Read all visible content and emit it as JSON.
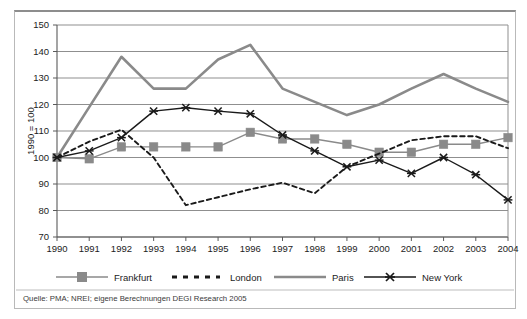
{
  "chart_data": {
    "type": "line",
    "title": "",
    "subtitle": "",
    "xlabel": "",
    "ylabel": "1990 = 100",
    "categories": [
      "1990",
      "1991",
      "1992",
      "1993",
      "1994",
      "1995",
      "1996",
      "1997",
      "1998",
      "1999",
      "2000",
      "2001",
      "2002",
      "2003",
      "2004"
    ],
    "x": [
      1990,
      1991,
      1992,
      1993,
      1994,
      1995,
      1996,
      1997,
      1998,
      1999,
      2000,
      2001,
      2002,
      2003,
      2004
    ],
    "ylim": [
      70,
      150
    ],
    "yticks": [
      70,
      80,
      90,
      100,
      110,
      120,
      130,
      140,
      150
    ],
    "grid": true,
    "legend_position": "bottom",
    "series": [
      {
        "name": "Frankfurt",
        "color": "#8a8a8a",
        "line_style": "solid",
        "marker": "square",
        "values": [
          100,
          99.5,
          104,
          104,
          104,
          104,
          109.5,
          107,
          107,
          105,
          102,
          102,
          105,
          105,
          107.5
        ]
      },
      {
        "name": "London",
        "color": "#1a1a1a",
        "line_style": "dashed",
        "marker": "none",
        "values": [
          100,
          106,
          110.5,
          100,
          82,
          85,
          88,
          90.5,
          86.5,
          96.5,
          101.5,
          106.5,
          108,
          108,
          103.5
        ]
      },
      {
        "name": "Paris",
        "color": "#8a8a8a",
        "line_style": "solid",
        "marker": "none",
        "values": [
          100,
          119,
          138,
          126,
          126,
          137,
          142.5,
          126,
          121,
          116,
          120,
          126,
          131.5,
          126,
          121
        ]
      },
      {
        "name": "New York",
        "color": "#1a1a1a",
        "line_style": "solid",
        "marker": "x",
        "values": [
          100,
          102.5,
          107.5,
          117.5,
          118.8,
          117.5,
          116.5,
          108.5,
          102.5,
          96.5,
          99,
          94,
          100,
          93.5,
          84
        ]
      }
    ]
  },
  "axis": {
    "y_label": "1990 = 100",
    "y_ticks": [
      "150",
      "140",
      "130",
      "120",
      "110",
      "100",
      "90",
      "80",
      "70"
    ],
    "x_ticks": [
      "1990",
      "1991",
      "1992",
      "1993",
      "1994",
      "1995",
      "1996",
      "1997",
      "1998",
      "1999",
      "2000",
      "2001",
      "2002",
      "2003",
      "2004"
    ]
  },
  "legend": {
    "items": [
      {
        "label": "Frankfurt",
        "marker": "square-marker",
        "color": "#8a8a8a",
        "style": "solid"
      },
      {
        "label": "London",
        "marker": "dash-marker",
        "color": "#1a1a1a",
        "style": "dashed"
      },
      {
        "label": "Paris",
        "marker": "line-marker",
        "color": "#8a8a8a",
        "style": "solid"
      },
      {
        "label": "New York",
        "marker": "x-marker",
        "color": "#1a1a1a",
        "style": "solid"
      }
    ]
  },
  "footer": {
    "source": "Quelle: PMA; NREI; eigene Berechnungen DEGI Research 2005"
  },
  "colors": {
    "gray_series": "#8a8a8a",
    "black_series": "#1a1a1a",
    "gridline": "#8f8f8f",
    "border": "#b9b9b9"
  }
}
